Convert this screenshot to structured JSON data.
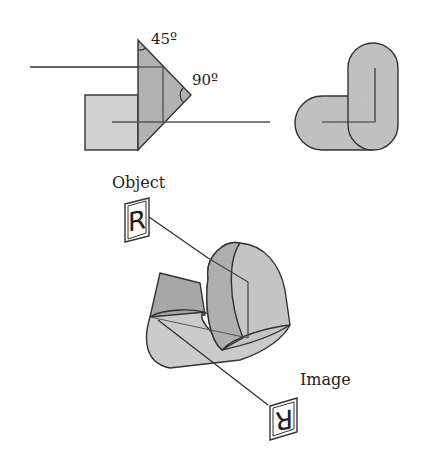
{
  "figure": {
    "top_left": {
      "angle_labels": [
        "45º",
        "90º"
      ]
    },
    "bottom": {
      "object_label": "Object",
      "image_label": "Image",
      "object_letter": "R",
      "image_letter": "R"
    }
  },
  "colors": {
    "stroke": "#333333",
    "fill_light": "#cfcfcf",
    "fill_mid": "#b8b8b8",
    "fill_dark": "#a9a9a9",
    "background": "#ffffff"
  }
}
